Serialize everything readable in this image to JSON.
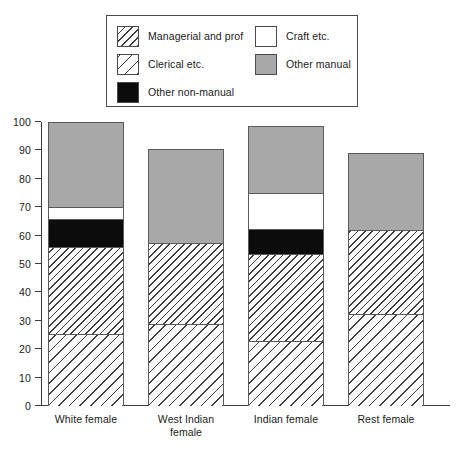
{
  "legend": {
    "entries_left": [
      {
        "label": "Managerial and prof",
        "fill": "fill-managerial",
        "icon": "hatch-forward-sparse-swatch"
      },
      {
        "label": "Clerical etc.",
        "fill": "fill-clerical",
        "icon": "hatch-forward-dense-swatch"
      },
      {
        "label": "Other non-manual",
        "fill": "fill-othernonmanual",
        "icon": "solid-black-swatch"
      }
    ],
    "entries_right": [
      {
        "label": "Craft etc.",
        "fill": "fill-craft",
        "icon": "solid-white-swatch"
      },
      {
        "label": "Other manual",
        "fill": "fill-othermanual",
        "icon": "solid-grey-swatch"
      }
    ]
  },
  "chart_data": {
    "type": "bar",
    "stacked": true,
    "title": "",
    "subtitle": "",
    "xlabel": "",
    "ylabel": "",
    "ylim": [
      0,
      100
    ],
    "yticks": [
      0,
      10,
      20,
      30,
      40,
      50,
      60,
      70,
      80,
      90,
      100
    ],
    "ytick_labels": [
      "0",
      "10",
      "20",
      "30",
      "40",
      "50",
      "60",
      "70",
      "80",
      "90",
      "100"
    ],
    "grid": false,
    "legend_position": "top-center",
    "categories": [
      "White female",
      "West Indian female",
      "Indian female",
      "Rest female"
    ],
    "category_lines": [
      [
        "White female"
      ],
      [
        "West Indian",
        "female"
      ],
      [
        "Indian female"
      ],
      [
        "Rest female"
      ]
    ],
    "series": [
      {
        "name": "Managerial and prof",
        "fill": "fill-managerial",
        "values": [
          25.5,
          29.0,
          23.0,
          32.5
        ]
      },
      {
        "name": "Clerical etc.",
        "fill": "fill-clerical",
        "values": [
          30.5,
          28.5,
          30.5,
          29.5
        ]
      },
      {
        "name": "Other non-manual",
        "fill": "fill-othernonmanual",
        "values": [
          10.0,
          0.0,
          9.0,
          0.0
        ]
      },
      {
        "name": "Craft etc.",
        "fill": "fill-craft",
        "values": [
          4.0,
          0.0,
          12.5,
          0.0
        ]
      },
      {
        "name": "Other manual",
        "fill": "fill-othermanual",
        "values": [
          30.0,
          33.0,
          23.5,
          27.0
        ]
      }
    ],
    "cumulative_tops": [
      [
        25.5,
        56.0,
        66.0,
        70.0,
        100.0
      ],
      [
        29.0,
        57.5,
        57.5,
        57.5,
        90.5
      ],
      [
        23.0,
        53.5,
        62.5,
        75.0,
        98.5
      ],
      [
        32.5,
        62.0,
        62.0,
        62.0,
        89.0
      ]
    ],
    "bar_totals": [
      100.0,
      90.5,
      98.5,
      89.0
    ]
  },
  "colors": {
    "grey_fill": "#a8a8a8",
    "black_fill": "#0c0c0c",
    "white_fill": "#ffffff",
    "hatch_line": "#3d3d3d",
    "axis": "#3a3a3a",
    "legend_border": "#4a4a4a"
  }
}
